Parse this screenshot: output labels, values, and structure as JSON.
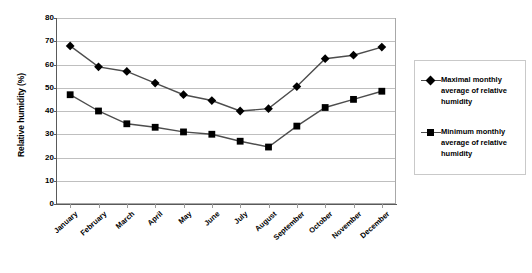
{
  "chart_data": {
    "type": "line",
    "title": "",
    "xlabel": "",
    "ylabel": "Relative humidity (%)",
    "ylim": [
      0,
      80
    ],
    "yticks": [
      0,
      10,
      20,
      30,
      40,
      50,
      60,
      70,
      80
    ],
    "grid": true,
    "legend_position": "right",
    "categories": [
      "January",
      "February",
      "March",
      "April",
      "May",
      "June",
      "July",
      "August",
      "September",
      "October",
      "November",
      "December"
    ],
    "series": [
      {
        "name": "Maximal monthly average of relative humidity",
        "marker": "diamond",
        "values": [
          68,
          59,
          57,
          52,
          47,
          44.5,
          40,
          41,
          50.5,
          62.5,
          64,
          67.5
        ]
      },
      {
        "name": "Minimum monthly average of relative humidity",
        "marker": "square",
        "values": [
          47,
          40,
          34.5,
          33,
          31,
          30,
          27,
          24.5,
          33.5,
          41.5,
          45,
          48.5
        ]
      }
    ],
    "colors": {
      "line": "#4d4d4d",
      "marker": "#000000",
      "gridline": "#bfbfbf",
      "axis": "#5a5a5a",
      "plot_border": "#a8a8a8",
      "legend_border": "#c9c9c9",
      "background": "#ffffff"
    }
  },
  "legend": {
    "entries": [
      {
        "label": "Maximal monthly average of relative humidity",
        "marker": "diamond-marker"
      },
      {
        "label": "Minimum monthly average of relative humidity",
        "marker": "square-marker"
      }
    ]
  },
  "axes": {
    "y_title": "Relative humidity (%)",
    "y_tick_labels": [
      "80",
      "70",
      "60",
      "50",
      "40",
      "30",
      "20",
      "10",
      "0"
    ],
    "x_tick_labels": [
      "January",
      "February",
      "March",
      "April",
      "May",
      "June",
      "July",
      "August",
      "September",
      "October",
      "November",
      "December"
    ]
  }
}
